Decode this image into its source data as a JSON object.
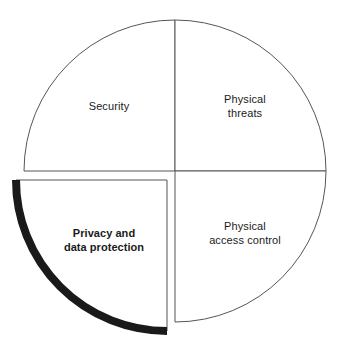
{
  "diagram": {
    "type": "quadrant-circle",
    "shape": "circle divided into four equal quadrants",
    "highlight": {
      "quadrant": "bottom-left",
      "style": "exploded-offset-with-thick-black-outer-arc",
      "arc_color": "#1a1a1a",
      "bold_label": true
    },
    "colors": {
      "background": "#ffffff",
      "outline": "#555555",
      "highlight_arc": "#1a1a1a",
      "text": "#1b1b1b"
    },
    "geometry": {
      "center_x": 175,
      "center_y": 171,
      "radius": 151,
      "offset_quadrant_dx": -8,
      "offset_quadrant_dy": 9
    },
    "quadrants": [
      {
        "id": "security",
        "position": "top-left",
        "label": "Security",
        "emphasis": false
      },
      {
        "id": "physical-threats",
        "position": "top-right",
        "label": "Physical\nthreats",
        "emphasis": false
      },
      {
        "id": "physical-access-control",
        "position": "bottom-right",
        "label": "Physical\naccess control",
        "emphasis": false
      },
      {
        "id": "privacy-and-data-protection",
        "position": "bottom-left",
        "label": "Privacy and\ndata protection",
        "emphasis": true
      }
    ]
  }
}
